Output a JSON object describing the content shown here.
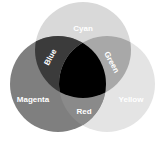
{
  "diagram": {
    "type": "venn",
    "circles": [
      {
        "name": "Cyan",
        "cx": 83,
        "cy": 50,
        "r": 48,
        "fill": "#d9d9d9"
      },
      {
        "name": "Magenta",
        "cx": 58,
        "cy": 84,
        "r": 48,
        "fill": "#7f7f7f"
      },
      {
        "name": "Yellow",
        "cx": 107,
        "cy": 84,
        "r": 48,
        "fill": "#e4e4e4"
      }
    ],
    "intersections": {
      "cyan_magenta": {
        "label": "Blue",
        "fill": "#3b3b3b"
      },
      "cyan_yellow": {
        "label": "Green",
        "fill": "#a8a8a8"
      },
      "magenta_yellow": {
        "label": "Red",
        "fill": "#8a8a8a"
      },
      "all": {
        "label": "",
        "fill": "#000000"
      }
    },
    "labels": {
      "cyan": "Cyan",
      "magenta": "Magenta",
      "yellow": "Yellow",
      "blue": "Blue",
      "green": "Green",
      "red": "Red"
    }
  }
}
